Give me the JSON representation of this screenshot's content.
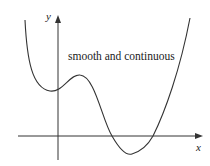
{
  "diagram": {
    "annotation": "smooth and continuous",
    "axes": {
      "x_label": "x",
      "y_label": "y"
    },
    "curve": {
      "description": "quartic-like curve: falls from upper left, local min near y-axis, local max, dips below x-axis, rises steeply to upper right",
      "color": "#333333"
    },
    "axis_color": "#333333"
  }
}
